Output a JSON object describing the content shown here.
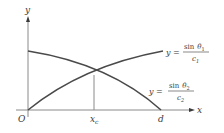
{
  "diagram": {
    "axes": {
      "x_label": "x",
      "y_label": "y",
      "origin_label": "O"
    },
    "ticks": {
      "crossing_label_main": "x",
      "crossing_label_sub": "c",
      "end_label": "d"
    },
    "curves": [
      {
        "name": "increasing",
        "label_lhs": "y =",
        "numerator_func": "sin",
        "numerator_var": "θ",
        "numerator_sub": "1",
        "denominator_var": "c",
        "denominator_sub": "1"
      },
      {
        "name": "decreasing",
        "label_lhs": "y =",
        "numerator_func": "sin",
        "numerator_var": "θ",
        "numerator_sub": "2",
        "denominator_var": "c",
        "denominator_sub": "2"
      }
    ],
    "colors": {
      "curve": "#4a4a4a",
      "axis": "#8a8a8a",
      "text": "#3a3a3a"
    }
  }
}
